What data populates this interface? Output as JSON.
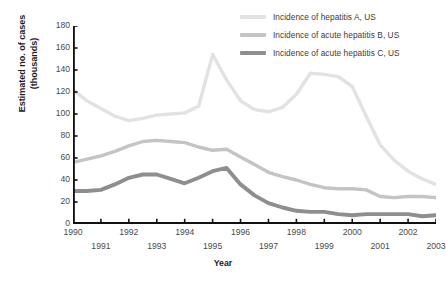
{
  "chart_data": {
    "type": "line",
    "title": "",
    "xlabel": "Year",
    "ylabel": "Estimated no. of cases (thousands)",
    "ylabel_line1": "Estimated no. of cases",
    "ylabel_line2": "(thousands)",
    "xlim": [
      1990,
      2003
    ],
    "ylim": [
      0,
      180
    ],
    "yticks": [
      0,
      20,
      40,
      60,
      80,
      100,
      120,
      140,
      160,
      180
    ],
    "ytick_labels": [
      "0",
      "20",
      "40",
      "60",
      "80",
      "100",
      "120",
      "140",
      "160",
      "180"
    ],
    "xticks": [
      1990,
      1991,
      1992,
      1993,
      1994,
      1995,
      1996,
      1997,
      1998,
      1999,
      2000,
      2001,
      2002,
      2003
    ],
    "xtick_labels": [
      "1990",
      "1991",
      "1992",
      "1993",
      "1994",
      "1995",
      "1996",
      "1997",
      "1998",
      "1999",
      "2000",
      "2001",
      "2002",
      "2003"
    ],
    "grid": false,
    "legend_position": "top-right",
    "x": [
      1990,
      1990.5,
      1991,
      1991.5,
      1992,
      1992.5,
      1993,
      1993.5,
      1994,
      1994.5,
      1995,
      1995.5,
      1996,
      1996.5,
      1997,
      1997.5,
      1998,
      1998.5,
      1999,
      1999.5,
      2000,
      2000.5,
      2001,
      2001.5,
      2002,
      2002.5,
      2003
    ],
    "series": [
      {
        "name": "Incidence of hepatitis A, US",
        "color": "#e2e2e2",
        "width": 3.4,
        "values": [
          122,
          112,
          105,
          98,
          94,
          96,
          99,
          100,
          101,
          107,
          154,
          131,
          112,
          104,
          102,
          106,
          118,
          137,
          136,
          134,
          125,
          98,
          72,
          58,
          48,
          41,
          36
        ]
      },
      {
        "name": "Incidence of acute hepatitis B, US",
        "color": "#c4c4c4",
        "width": 3.4,
        "values": [
          56,
          59,
          62,
          66,
          71,
          75,
          76,
          75,
          74,
          70,
          67,
          68,
          61,
          54,
          47,
          43,
          40,
          36,
          33,
          32,
          32,
          31,
          25,
          24,
          25,
          25,
          24
        ]
      },
      {
        "name": "Incidence of acute hepatitis C, US",
        "color": "#8e8e8e",
        "width": 3.9,
        "values": [
          30,
          30,
          31,
          36,
          42,
          45,
          45,
          41,
          37,
          42,
          48,
          51,
          36,
          26,
          19,
          15,
          12,
          11,
          11,
          9,
          8,
          9,
          9,
          9,
          9,
          7,
          8
        ]
      }
    ]
  }
}
